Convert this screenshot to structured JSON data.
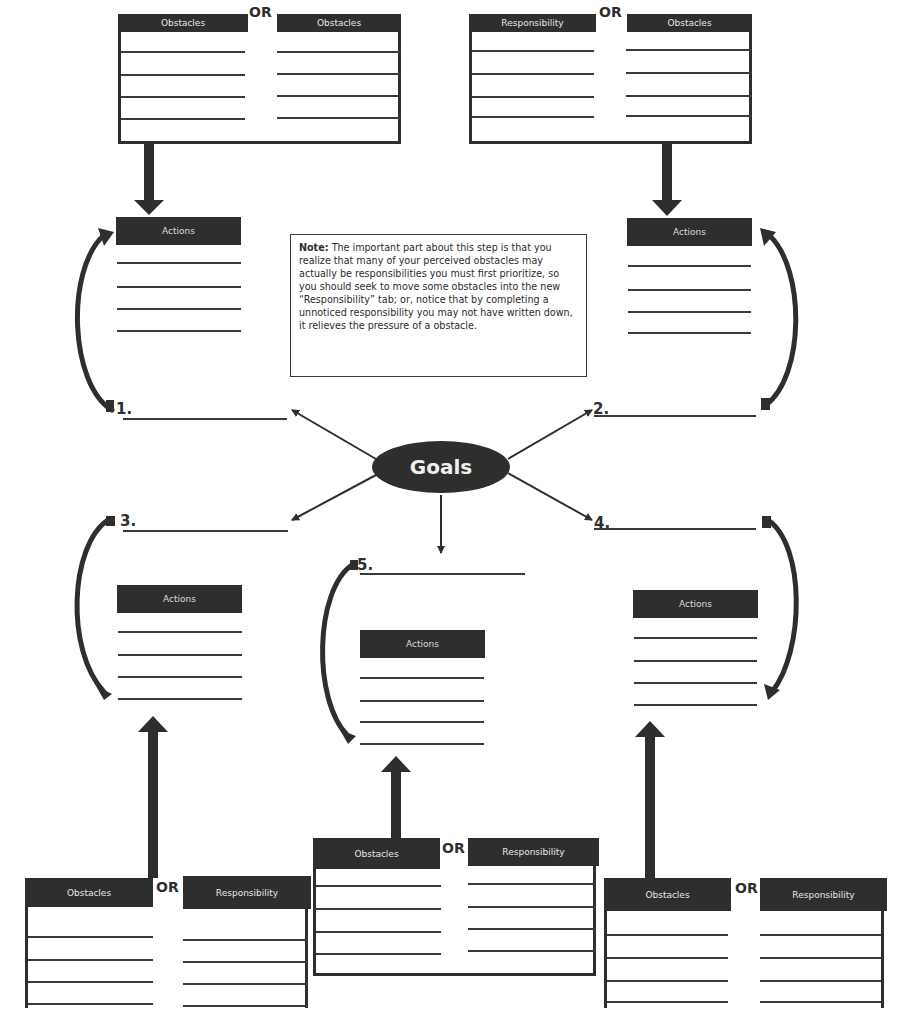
{
  "labels": {
    "obstacles": "Obstacles",
    "responsibility": "Responsibility",
    "or": "OR",
    "actions": "Actions",
    "goals": "Goals"
  },
  "note": {
    "heading": "Note:",
    "body": "The important part about this step is that you realize that many of your perceived obstacles may actually be responsibilities you must first prioritize, so you should seek to move some obstacles into the new “Responsibility” tab; or, notice that by completing a unnoticed responsibility you may not have written down, it relieves the pressure of a obstacle."
  },
  "goals": [
    {
      "number": "1.",
      "value": ""
    },
    {
      "number": "2.",
      "value": ""
    },
    {
      "number": "3.",
      "value": ""
    },
    {
      "number": "4.",
      "value": ""
    },
    {
      "number": "5.",
      "value": ""
    }
  ],
  "boxes": {
    "top_left": {
      "left_header": "Obstacles",
      "right_header": "Responsibility",
      "or": "OR"
    },
    "top_right": {
      "left_header": "Responsibility",
      "right_header": "Obstacles",
      "or": "OR"
    },
    "bottom_left": {
      "left_header": "Obstacles",
      "right_header": "Responsibility",
      "or": "OR"
    },
    "bottom_center": {
      "left_header": "Obstacles",
      "right_header": "Responsibility",
      "or": "OR"
    },
    "bottom_right": {
      "left_header": "Obstacles",
      "right_header": "Responsibility",
      "or": "OR"
    }
  },
  "actions": [
    {
      "label": "Actions"
    },
    {
      "label": "Actions"
    },
    {
      "label": "Actions"
    },
    {
      "label": "Actions"
    },
    {
      "label": "Actions"
    }
  ],
  "colors": {
    "dark": "#2e2e2e",
    "header_text": "#e8e8e8",
    "line": "#3a3a3a",
    "background": "#ffffff"
  }
}
